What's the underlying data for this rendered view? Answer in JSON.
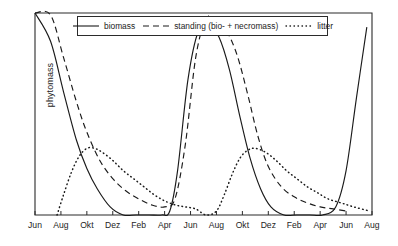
{
  "chart_data": {
    "type": "line",
    "title": "",
    "subtitle": "",
    "xlabel": "",
    "ylabel": "phytomass",
    "grid": false,
    "legend_position": "top-center",
    "x_tick_labels": [
      "Jun",
      "Aug",
      "Okt",
      "Dez",
      "Feb",
      "Apr",
      "Jun",
      "Aug",
      "Okt",
      "Dez",
      "Feb",
      "Apr",
      "Jun",
      "Aug"
    ],
    "y_tick_labels": [],
    "xlim": [
      0,
      13
    ],
    "ylim": [
      0,
      1
    ],
    "axis_note": "y-axis unlabelled / qualitative scale, no numeric ticks",
    "series": [
      {
        "name": "biomass",
        "style": "solid",
        "color": "#1a1a1a",
        "x": [
          0.0,
          0.6,
          1.1,
          1.6,
          2.0,
          2.4,
          2.9,
          3.4,
          3.9,
          4.4,
          4.9,
          5.2,
          5.5,
          5.9,
          6.3,
          6.7,
          7.1,
          7.5,
          7.9,
          8.3,
          8.7,
          9.1,
          9.6,
          10.1,
          10.6,
          11.1,
          11.6,
          12.0,
          12.4,
          12.8
        ],
        "y": [
          1.02,
          0.86,
          0.61,
          0.37,
          0.23,
          0.13,
          0.04,
          0.0,
          0.0,
          0.0,
          0.0,
          0.02,
          0.22,
          0.67,
          0.91,
          0.94,
          0.88,
          0.72,
          0.49,
          0.28,
          0.13,
          0.04,
          0.0,
          0.0,
          0.0,
          0.0,
          0.04,
          0.22,
          0.58,
          0.93
        ]
      },
      {
        "name": "standing (bio- + necromass)",
        "style": "dashed",
        "color": "#1a1a1a",
        "x": [
          0.0,
          0.6,
          1.1,
          1.6,
          2.0,
          2.5,
          3.0,
          3.5,
          4.0,
          4.5,
          5.0,
          5.4,
          5.8,
          6.2,
          6.6,
          7.0,
          7.4,
          7.8,
          8.2,
          8.6,
          9.0,
          9.5,
          10.0,
          10.5,
          11.0,
          11.5,
          12.0
        ],
        "y": [
          1.13,
          0.99,
          0.78,
          0.56,
          0.41,
          0.27,
          0.18,
          0.12,
          0.08,
          0.05,
          0.04,
          0.08,
          0.35,
          0.78,
          0.97,
          0.97,
          0.91,
          0.79,
          0.6,
          0.39,
          0.24,
          0.14,
          0.09,
          0.06,
          0.04,
          0.03,
          0.02
        ]
      },
      {
        "name": "litter",
        "style": "dotted",
        "color": "#1a1a1a",
        "x": [
          0.85,
          1.1,
          1.4,
          1.7,
          2.0,
          2.3,
          2.6,
          3.0,
          3.4,
          3.8,
          4.2,
          4.6,
          5.0,
          5.4,
          5.8,
          6.2,
          6.6,
          7.0,
          7.3,
          7.6,
          7.9,
          8.2,
          8.5,
          8.9,
          9.3,
          9.7,
          10.1,
          10.5,
          10.9,
          11.3,
          11.8,
          12.3,
          12.9
        ],
        "y": [
          0.0,
          0.1,
          0.21,
          0.29,
          0.33,
          0.33,
          0.31,
          0.27,
          0.22,
          0.18,
          0.14,
          0.1,
          0.07,
          0.05,
          0.04,
          0.03,
          0.0,
          0.02,
          0.1,
          0.2,
          0.28,
          0.32,
          0.33,
          0.31,
          0.27,
          0.22,
          0.18,
          0.14,
          0.11,
          0.08,
          0.06,
          0.04,
          0.02
        ]
      }
    ]
  },
  "legend": {
    "entries": [
      {
        "label": "biomass",
        "key": "solid-line-key"
      },
      {
        "label": "standing (bio- + necromass)",
        "key": "dashed-line-key"
      },
      {
        "label": "litter",
        "key": "dotted-line-key"
      }
    ]
  },
  "axes": {
    "y_axis_title": "phytomass"
  }
}
